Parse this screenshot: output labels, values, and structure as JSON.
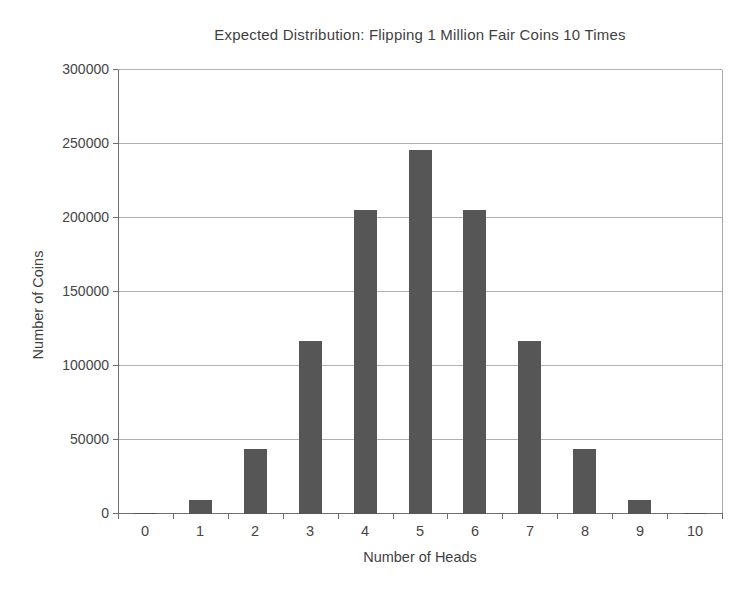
{
  "chart_data": {
    "type": "bar",
    "title": "Expected Distribution: Flipping 1 Million Fair Coins 10 Times",
    "xlabel": "Number of Heads",
    "ylabel": "Number of Coins",
    "categories": [
      "0",
      "1",
      "2",
      "3",
      "4",
      "5",
      "6",
      "7",
      "8",
      "9",
      "10"
    ],
    "values": [
      977,
      9766,
      43945,
      117188,
      205078,
      246094,
      205078,
      117188,
      43945,
      9766,
      977
    ],
    "ylim": [
      0,
      300000
    ],
    "ytick_step": 50000,
    "ytick_labels": [
      "0",
      "50000",
      "100000",
      "150000",
      "200000",
      "250000",
      "300000"
    ],
    "grid": "horizontal",
    "legend": "none",
    "colors": {
      "bar": "#565656",
      "gridline": "#b0b0b0",
      "plot_border": "#a8a8a8",
      "axis": "#6e6e6e",
      "text": "#444444",
      "background": "#ffffff"
    }
  }
}
